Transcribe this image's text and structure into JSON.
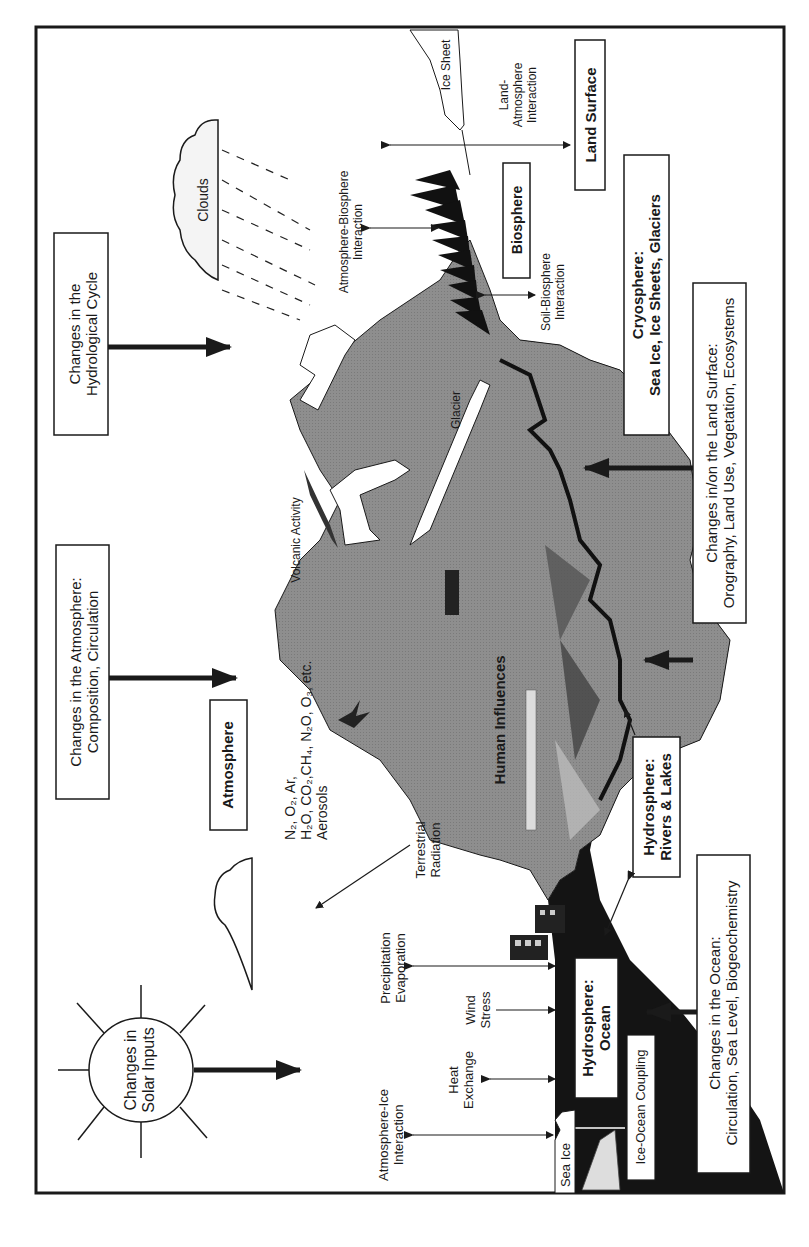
{
  "figure": {
    "orientation": "rotated-90-ccw",
    "colors": {
      "land": "#8c8c8c",
      "ocean": "#141414",
      "outline": "#1a1a1a",
      "background": "#ffffff",
      "snow": "#ffffff"
    },
    "boxes": {
      "solar": [
        "Changes in",
        "Solar Inputs"
      ],
      "hydro_cycle": [
        "Changes in the",
        "Hydrological Cycle"
      ],
      "atmos_change": [
        "Changes in the Atmosphere:",
        "Composition, Circulation"
      ],
      "atmosphere": "Atmosphere",
      "biosphere": "Biosphere",
      "land_surface": "Land Surface",
      "cryosphere": [
        "Cryosphere:",
        "Sea Ice, Ice Sheets, Glaciers"
      ],
      "land_change": [
        "Changes in/on the Land Surface:",
        "Orography, Land Use, Vegetation, Ecosystems"
      ],
      "rivers": [
        "Hydrosphere:",
        "Rivers & Lakes"
      ],
      "ocean": [
        "Hydrosphere:",
        "Ocean"
      ],
      "ocean_change": [
        "Changes in the Ocean:",
        "Circulation, Sea Level, Biogeochemistry"
      ],
      "ice_ocean": "Ice-Ocean Coupling"
    },
    "labels": {
      "clouds": "Clouds",
      "volcanic": "Volcanic Activity",
      "glacier": "Glacier",
      "ice_sheet": "Ice Sheet",
      "sea_ice": "Sea Ice",
      "human": "Human Influences",
      "atm_bio": [
        "Atmosphere-Biosphere",
        "Interaction"
      ],
      "land_atm": [
        "Land-",
        "Atmosphere",
        "Interaction"
      ],
      "soil_bio": [
        "Soil-Biosphere",
        "Interaction"
      ],
      "terrestrial": [
        "Terrestrial",
        "Radiation"
      ],
      "gases": [
        "N₂, O₂, Ar,",
        "H₂O, CO₂,CH₄, N₂O, O₃, etc.",
        "Aerosols"
      ],
      "precip": [
        "Precipitation",
        "Evaporation"
      ],
      "wind": [
        "Wind",
        "Stress"
      ],
      "heat": [
        "Heat",
        "Exchange"
      ],
      "atm_ice": [
        "Atmosphere-Ice",
        "Interaction"
      ]
    }
  }
}
